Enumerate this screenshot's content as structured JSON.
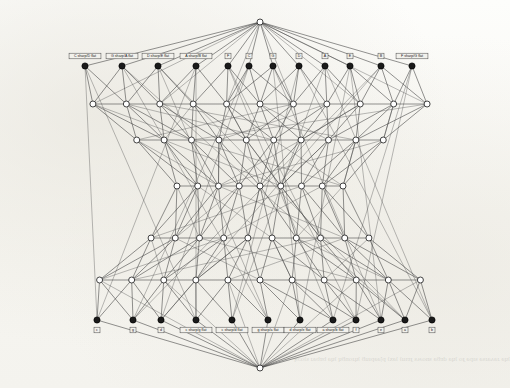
{
  "figure": {
    "background_color": "#fbfbf9",
    "ink_color": "#2e2e2e",
    "node_fill_open": "#ffffff",
    "node_fill_solid": "#1a1a1a",
    "label_box_fill": "#f2f1ec"
  },
  "apex": {
    "top": {
      "name": "top-apex-node",
      "x": 260,
      "y": 22
    },
    "bottom": {
      "name": "bottom-apex-node",
      "x": 260,
      "y": 368
    }
  },
  "top_row": {
    "description": "Uppercase pitch-class labels along the upper rank",
    "y_label": 56,
    "y_node": 66,
    "labels": [
      "C sharp/D flat",
      "G sharp/A flat",
      "D sharp/E flat",
      "A sharp/B flat",
      "F",
      "C",
      "G",
      "D",
      "A",
      "E",
      "B",
      "F sharp/G flat"
    ],
    "x": [
      85,
      122,
      158,
      196,
      228,
      249,
      273,
      299,
      325,
      350,
      381,
      412
    ]
  },
  "bottom_row": {
    "description": "Lowercase pitch-class labels along the lower rank",
    "y_label": 330,
    "y_node": 320,
    "labels": [
      "c",
      "g",
      "d",
      "c sharp/g flat",
      "c sharp/d flat",
      "g sharp/a flat",
      "d sharp/e flat",
      "a sharp/b flat",
      "f",
      "e",
      "a",
      "b"
    ],
    "x": [
      97,
      133,
      161,
      196,
      232,
      268,
      300,
      333,
      356,
      381,
      405,
      432
    ]
  },
  "chart_data": {
    "type": "graph",
    "node_count_total": 74,
    "rank_count": 7,
    "ranks": [
      {
        "index": 0,
        "y": 22,
        "count": 1,
        "style": "open",
        "note": "top apex"
      },
      {
        "index": 1,
        "y": 66,
        "count": 12,
        "style": "filled",
        "note": "uppercase labelled rank"
      },
      {
        "index": 2,
        "y": 104,
        "count": 11,
        "style": "open",
        "note": ""
      },
      {
        "index": 3,
        "y": 140,
        "count": 10,
        "style": "open",
        "note": ""
      },
      {
        "index": 4,
        "y": 186,
        "count": 9,
        "style": "open",
        "note": ""
      },
      {
        "index": 5,
        "y": 238,
        "count": 10,
        "style": "open",
        "note": ""
      },
      {
        "index": 6,
        "y": 280,
        "count": 11,
        "style": "open",
        "note": ""
      },
      {
        "index": 7,
        "y": 320,
        "count": 12,
        "style": "filled",
        "note": "lowercase labelled rank"
      },
      {
        "index": 8,
        "y": 368,
        "count": 1,
        "style": "open",
        "note": "bottom apex"
      }
    ],
    "legend": [],
    "grid": false,
    "xlabel": "",
    "ylabel": ""
  }
}
